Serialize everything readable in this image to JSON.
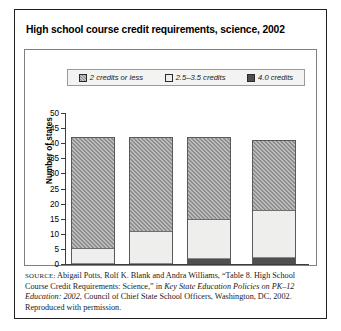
{
  "figure": {
    "title": "High school course credit requirements, science, 2002",
    "source_prefix": "SOURCE:",
    "source_part1": " Abigail Potts, Rolf K. Blank and Andra Williams, “Table 8. High School Course Credit Requirements: Science,” in ",
    "source_italic1": "Key State Education Policies on PK–12 Education: 2002",
    "source_part2": ", Council of Chief State School Officers, Washington, DC, 2002. Reproduced with permission."
  },
  "chart_data": {
    "type": "bar",
    "subtype": "stacked-bar",
    "title": "High school course credit requirements, science, 2002",
    "xlabel": "",
    "ylabel": "Number of states",
    "ylim": [
      0,
      50
    ],
    "yticks": [
      50,
      45,
      40,
      35,
      30,
      25,
      20,
      15,
      10,
      5,
      0
    ],
    "grid": false,
    "legend_position": "top",
    "categories": [
      "1",
      "2",
      "3",
      "4"
    ],
    "series": [
      {
        "name": "2 credits or less",
        "color": "#8e8e8e",
        "values": [
          37,
          31.5,
          27.5,
          23.5
        ]
      },
      {
        "name": "2.5–3.5 credits",
        "color": "#eeeeec",
        "values": [
          5,
          10.5,
          13,
          15.5
        ]
      },
      {
        "name": "4.0 credits",
        "color": "#4f4f4f",
        "values": [
          0,
          0,
          1.5,
          2
        ]
      }
    ],
    "totals": [
      42,
      42,
      42,
      41
    ]
  },
  "legend": {
    "items": [
      {
        "label": "2 credits or less",
        "swatch": "hatched-gray-swatch"
      },
      {
        "label": "2.5–3.5 credits",
        "swatch": "light-swatch"
      },
      {
        "label": "4.0 credits",
        "swatch": "dark-swatch"
      }
    ]
  }
}
